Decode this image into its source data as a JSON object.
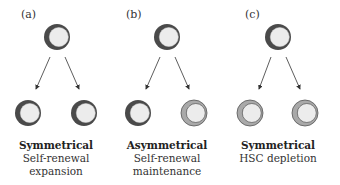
{
  "panels": [
    {
      "label": "(a)",
      "division_type": "Symmetrical",
      "description_lines": [
        "Self-renewal",
        "expansion"
      ],
      "parent": "stem-cell",
      "daughters": [
        "stem-cell",
        "stem-cell"
      ]
    },
    {
      "label": "(b)",
      "division_type": "Asymmetrical",
      "description_lines": [
        "Self-renewal",
        "maintenance"
      ],
      "parent": "stem-cell",
      "daughters": [
        "stem-cell",
        "differentiated-cell"
      ]
    },
    {
      "label": "(c)",
      "division_type": "Symmetrical",
      "description_lines": [
        "HSC depletion"
      ],
      "parent": "stem-cell",
      "daughters": [
        "differentiated-cell",
        "differentiated-cell"
      ]
    }
  ],
  "colors": {
    "stem_ring": "#4a4a4a",
    "diff_ring": "#a9a9a9",
    "cell_inner": "#ececec",
    "arrow": "#333333"
  }
}
